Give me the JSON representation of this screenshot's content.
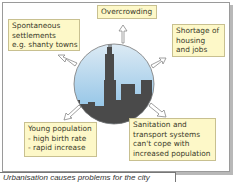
{
  "diagram": {
    "center_image": "city-skyline-circle",
    "boxes": [
      {
        "id": "spontaneous",
        "lines": [
          "Spontaneous",
          "settlements",
          "e.g. shanty towns"
        ]
      },
      {
        "id": "overcrowding",
        "lines": [
          "Overcrowding"
        ]
      },
      {
        "id": "shortage",
        "lines": [
          "Shortage of",
          "housing",
          "and jobs"
        ]
      },
      {
        "id": "young",
        "lines": [
          "Young population",
          "- high birth rate",
          "- rapid increase"
        ]
      },
      {
        "id": "sanitation",
        "lines": [
          "Sanitation and",
          "transport systems",
          "can't cope with",
          "increased population"
        ]
      }
    ],
    "caption": "Urbanisation causes problems for the city",
    "colors": {
      "box_fill": "#fdf8c8",
      "sky_top": "#d6e6f2",
      "sky_bottom": "#8ec3e6",
      "skyline": "#4a4a4a"
    }
  }
}
